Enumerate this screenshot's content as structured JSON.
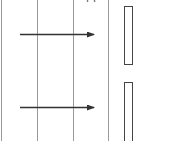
{
  "diagram": {
    "type": "sequence-diagram-fragment",
    "top_label_fragment": "pp",
    "colors": {
      "background": "#ffffff",
      "lifeline": "#9a9a9a",
      "arrow": "#333333",
      "activation_box": "#444444"
    },
    "lifelines": [
      {
        "id": "lifeline-1",
        "x": 1
      },
      {
        "id": "lifeline-2",
        "x": 37
      },
      {
        "id": "lifeline-3",
        "x": 73
      },
      {
        "id": "lifeline-4",
        "x": 108
      }
    ],
    "messages": [
      {
        "id": "message-1",
        "from_x": 20,
        "to_x": 94,
        "y": 34
      },
      {
        "id": "message-2",
        "from_x": 20,
        "to_x": 94,
        "y": 107
      }
    ],
    "activation_boxes": [
      {
        "id": "activation-1",
        "x": 124,
        "y": 6,
        "width": 8,
        "height": 58
      },
      {
        "id": "activation-2",
        "x": 124,
        "y": 82,
        "width": 8,
        "height": 62
      }
    ]
  }
}
